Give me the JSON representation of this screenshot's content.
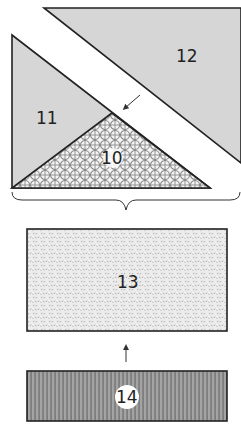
{
  "diagram": {
    "pieces": [
      {
        "id": "12",
        "label": "12",
        "shape": "triangle",
        "fill": "#d6d6d6"
      },
      {
        "id": "11",
        "label": "11",
        "shape": "triangle",
        "fill": "#d6d6d6"
      },
      {
        "id": "10",
        "label": "10",
        "shape": "triangle",
        "fill": "lattice-pattern"
      },
      {
        "id": "13",
        "label": "13",
        "shape": "rectangle",
        "fill": "speckle-pattern"
      },
      {
        "id": "14",
        "label": "14",
        "shape": "rectangle",
        "fill": "dark-texture"
      }
    ],
    "arrows": [
      {
        "name": "arrow-to-10",
        "direction": "down-left"
      },
      {
        "name": "arrow-14-to-13",
        "direction": "up"
      }
    ],
    "brace": {
      "name": "grouping-brace",
      "groups": [
        "10",
        "11",
        "12"
      ]
    }
  }
}
